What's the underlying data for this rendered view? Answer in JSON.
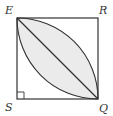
{
  "diagram": {
    "type": "geometry",
    "shape": "square",
    "vertices": {
      "E": {
        "label": "E",
        "position": "top-left"
      },
      "R": {
        "label": "R",
        "position": "top-right"
      },
      "S": {
        "label": "S",
        "position": "bottom-left"
      },
      "Q": {
        "label": "Q",
        "position": "bottom-right"
      }
    },
    "segments": [
      "ER",
      "RQ",
      "QS",
      "SE",
      "EQ"
    ],
    "arcs": [
      {
        "center": "S",
        "from": "E",
        "to": "Q"
      },
      {
        "center": "R",
        "from": "E",
        "to": "Q"
      }
    ],
    "right_angle_marker": "S",
    "shaded_region": "lens between arcs EQ",
    "colors": {
      "stroke": "#333333",
      "shade": "#ebebeb",
      "background": "#ffffff"
    }
  }
}
